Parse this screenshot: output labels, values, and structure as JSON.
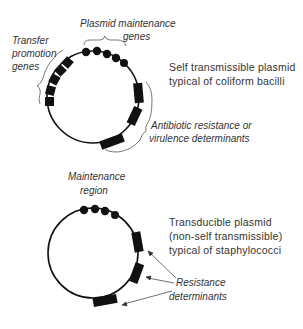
{
  "plasmid1": {
    "labels": {
      "maintenance_line1": "Plasmid maintenance",
      "maintenance_line2": "genes",
      "transfer_line1": "Transfer",
      "transfer_line2": "promotion",
      "transfer_line3": "genes",
      "resistance_line1": "Antibiotic resistance or",
      "resistance_line2": "virulence determinants"
    },
    "description": {
      "line1": "Self transmissible plasmid",
      "line2": "typical of coliform bacilli"
    }
  },
  "plasmid2": {
    "labels": {
      "maintenance_line1": "Maintenance",
      "maintenance_line2": "region",
      "resistance_line1": "Resistance",
      "resistance_line2": "determinants"
    },
    "description": {
      "line1": "Transducible plasmid",
      "line2": "(non-self transmissible)",
      "line3": "typical of  staphylococci"
    }
  },
  "colors": {
    "ink": "#111111",
    "text": "#333333",
    "background": "#ffffff"
  }
}
